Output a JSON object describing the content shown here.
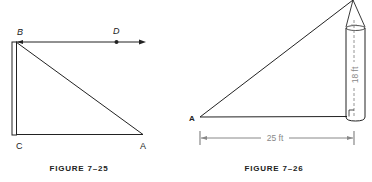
{
  "figures": [
    {
      "caption": "FIGURE 7–25",
      "labels": {
        "B": "B",
        "D": "D",
        "C": "C",
        "A": "A"
      }
    },
    {
      "caption": "FIGURE 7–26",
      "labels": {
        "A": "A"
      },
      "dimensions": {
        "height": "18 ft",
        "base": "25 ft"
      }
    }
  ],
  "colors": {
    "line": "#222222",
    "dimension": "#888888"
  }
}
